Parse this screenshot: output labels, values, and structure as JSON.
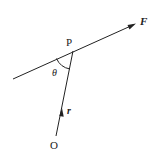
{
  "diagram": {
    "labels": {
      "point": "P",
      "origin": "O",
      "force": "F",
      "position": "r",
      "angle": "θ"
    },
    "colors": {
      "stroke": "#222222",
      "background": "#ffffff"
    }
  }
}
